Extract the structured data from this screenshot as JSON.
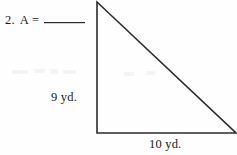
{
  "problem": {
    "number": "2.",
    "expression": "A =",
    "answer_value": "",
    "answer_blank_placeholder": "________"
  },
  "figure": {
    "shape_name": "right-triangle",
    "stroke_color": "#2b2b2b",
    "vertices": {
      "apex": {
        "x": 97,
        "y": 2
      },
      "bottom_left": {
        "x": 97,
        "y": 133
      },
      "bottom_right": {
        "x": 236,
        "y": 133
      }
    },
    "labels": {
      "height": "9 yd.",
      "base": "10 yd."
    }
  }
}
